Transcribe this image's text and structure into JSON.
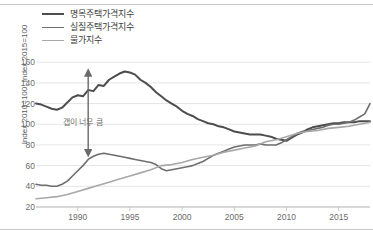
{
  "chart_data": {
    "type": "line",
    "title": "",
    "xlabel": "",
    "ylabel": "Index 2010=100, Index 2015=100",
    "xlim": [
      1986,
      2018
    ],
    "ylim": [
      20,
      165
    ],
    "ytick_values": [
      20,
      40,
      60,
      80,
      100,
      120,
      140,
      160
    ],
    "xtick_values": [
      1990,
      1995,
      2000,
      2005,
      2010,
      2015
    ],
    "grid": true,
    "legend_position": "top-left",
    "annotations": [
      {
        "text": "갭이 너무 큼",
        "x": 1988.6,
        "y": 103,
        "type": "label"
      },
      {
        "type": "double-arrow",
        "x": 1991.0,
        "y_top": 150,
        "y_bottom": 72
      }
    ],
    "series": [
      {
        "name": "명목주택가격지수",
        "color": "#4d4d4d",
        "width": 2.0,
        "x": [
          1986,
          1986.5,
          1987,
          1987.5,
          1988,
          1988.5,
          1989,
          1989.5,
          1990,
          1990.5,
          1991,
          1991.5,
          1992,
          1992.5,
          1993,
          1993.5,
          1994,
          1994.5,
          1995,
          1995.5,
          1996,
          1996.5,
          1997,
          1997.5,
          1998,
          1998.5,
          1999,
          1999.5,
          2000,
          2000.5,
          2001,
          2001.5,
          2002,
          2002.5,
          2003,
          2003.5,
          2004,
          2004.5,
          2005,
          2005.5,
          2006,
          2006.5,
          2007,
          2007.5,
          2008,
          2008.5,
          2009,
          2009.5,
          2010,
          2010.5,
          2011,
          2011.5,
          2012,
          2012.5,
          2013,
          2013.5,
          2014,
          2014.5,
          2015,
          2015.5,
          2016,
          2016.5,
          2017,
          2017.5,
          2018
        ],
        "values": [
          120,
          119,
          117,
          115,
          114,
          116,
          121,
          126,
          128,
          127,
          133,
          132,
          138,
          137,
          143,
          146,
          149,
          151,
          150,
          148,
          143,
          140,
          136,
          131,
          127,
          123,
          120,
          117,
          113,
          110,
          108,
          105,
          103,
          101,
          100,
          98,
          97,
          95,
          93,
          92,
          91,
          90,
          90,
          90,
          89,
          88,
          86,
          85,
          84,
          87,
          90,
          92,
          95,
          97,
          98,
          99,
          100,
          101,
          101,
          102,
          102,
          102,
          103,
          103,
          103
        ]
      },
      {
        "name": "실질주택가격지수",
        "color": "#6e6e6e",
        "width": 1.6,
        "x": [
          1986,
          1986.5,
          1987,
          1987.5,
          1988,
          1988.5,
          1989,
          1989.5,
          1990,
          1990.5,
          1991,
          1991.5,
          1992,
          1992.5,
          1993,
          1993.5,
          1994,
          1994.5,
          1995,
          1995.5,
          1996,
          1996.5,
          1997,
          1997.5,
          1998,
          1998.5,
          1999,
          1999.5,
          2000,
          2000.5,
          2001,
          2001.5,
          2002,
          2002.5,
          2003,
          2003.5,
          2004,
          2004.5,
          2005,
          2005.5,
          2006,
          2006.5,
          2007,
          2007.5,
          2008,
          2008.5,
          2009,
          2009.5,
          2010,
          2010.5,
          2011,
          2011.5,
          2012,
          2012.5,
          2013,
          2013.5,
          2014,
          2014.5,
          2015,
          2015.5,
          2016,
          2016.5,
          2017,
          2017.5,
          2018
        ],
        "values": [
          42,
          41,
          41,
          40,
          40,
          42,
          45,
          50,
          55,
          60,
          66,
          69,
          71,
          72,
          71,
          70,
          69,
          68,
          67,
          66,
          65,
          64,
          63,
          61,
          57,
          55,
          56,
          57,
          58,
          59,
          60,
          62,
          64,
          67,
          70,
          72,
          74,
          76,
          78,
          79,
          80,
          80,
          80,
          81,
          80,
          80,
          80,
          82,
          85,
          88,
          91,
          93,
          94,
          95,
          96,
          97,
          99,
          100,
          100,
          101,
          102,
          104,
          107,
          110,
          120
        ]
      },
      {
        "name": "물가지수",
        "color": "#a8a8a8",
        "width": 1.6,
        "x": [
          1986,
          1987,
          1988,
          1989,
          1990,
          1991,
          1992,
          1993,
          1994,
          1995,
          1996,
          1997,
          1998,
          1999,
          2000,
          2001,
          2002,
          2003,
          2004,
          2005,
          2006,
          2007,
          2008,
          2009,
          2010,
          2011,
          2012,
          2013,
          2014,
          2015,
          2016,
          2017,
          2018
        ],
        "values": [
          28,
          29,
          30,
          32,
          35,
          38,
          41,
          44,
          47,
          50,
          53,
          56,
          60,
          61,
          63,
          66,
          68,
          70,
          73,
          75,
          77,
          79,
          83,
          85,
          88,
          91,
          93,
          94,
          96,
          97,
          98,
          100,
          102
        ]
      }
    ]
  }
}
